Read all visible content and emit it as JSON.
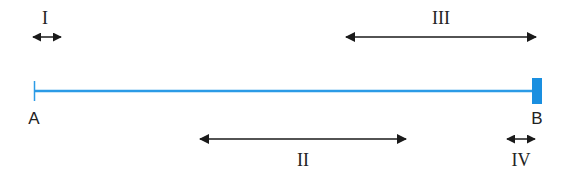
{
  "colors": {
    "segment": "#2b9be6",
    "endcap": "#1a8fe0",
    "arrow": "#1a1a1a",
    "text": "#222222"
  },
  "segment": {
    "start_label": "A",
    "end_label": "B",
    "x1": 34,
    "x2": 536,
    "y": 91
  },
  "arrows": [
    {
      "id": "I",
      "label": "I",
      "x1": 33,
      "x2": 61,
      "y": 37,
      "label_x": 44,
      "label_y": 24
    },
    {
      "id": "III",
      "label": "III",
      "x1": 346,
      "x2": 536,
      "y": 37,
      "label_x": 441,
      "label_y": 24
    },
    {
      "id": "II",
      "label": "II",
      "x1": 200,
      "x2": 406,
      "y": 139,
      "label_x": 303,
      "label_y": 165
    },
    {
      "id": "IV",
      "label": "IV",
      "x1": 507,
      "x2": 535,
      "y": 139,
      "label_x": 521,
      "label_y": 165
    }
  ]
}
